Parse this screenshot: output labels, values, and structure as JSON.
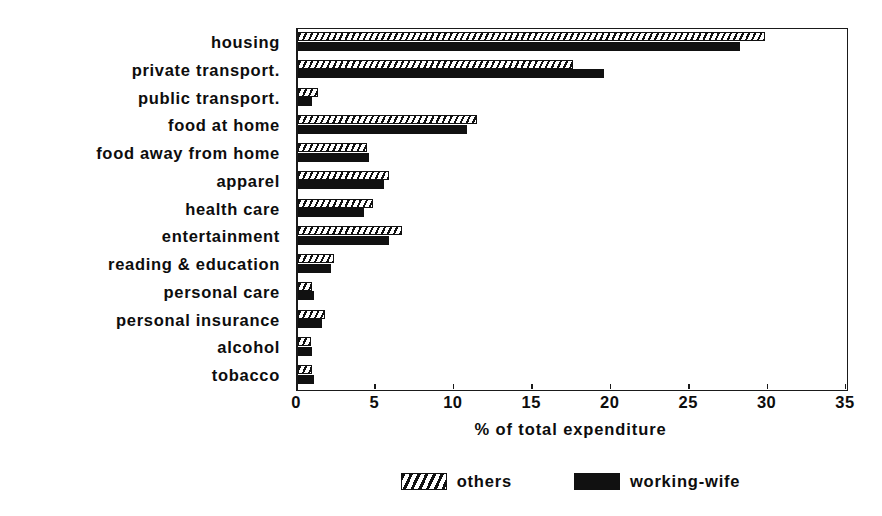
{
  "chart_data": {
    "type": "bar",
    "orientation": "horizontal",
    "title": "",
    "xlabel": "% of total expenditure",
    "ylabel": "",
    "xlim": [
      0,
      35
    ],
    "xticks": [
      0,
      5,
      10,
      15,
      20,
      25,
      30,
      35
    ],
    "grid": false,
    "legend_position": "bottom-center",
    "categories": [
      "housing",
      "private transport.",
      "public transport.",
      "food at home",
      "food away from home",
      "apparel",
      "health care",
      "entertainment",
      "reading & education",
      "personal care",
      "personal insurance",
      "alcohol",
      "tobacco"
    ],
    "series": [
      {
        "name": "others",
        "pattern": "diagonal-hatch",
        "color": "#ffffff",
        "values": [
          29.8,
          17.5,
          1.3,
          11.4,
          4.4,
          5.8,
          4.8,
          6.6,
          2.3,
          0.9,
          1.7,
          0.8,
          0.9
        ]
      },
      {
        "name": "working-wife",
        "pattern": "solid",
        "color": "#111111",
        "values": [
          28.2,
          19.5,
          0.9,
          10.8,
          4.5,
          5.5,
          4.2,
          5.8,
          2.1,
          1.0,
          1.5,
          0.9,
          1.0
        ]
      }
    ]
  },
  "legend": {
    "entries": [
      {
        "label": "others",
        "swatch": "hatched-swatch"
      },
      {
        "label": "working-wife",
        "swatch": "black-swatch"
      }
    ]
  }
}
